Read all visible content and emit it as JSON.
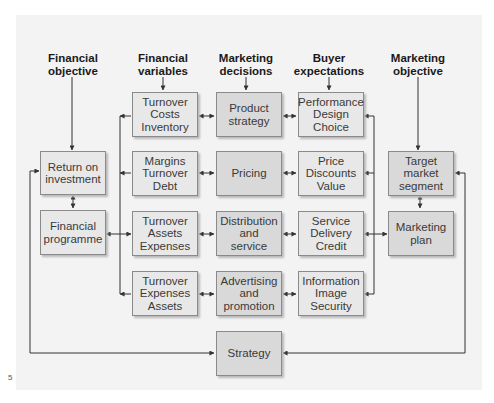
{
  "headings": {
    "financial_objective": [
      "Financial",
      "objective"
    ],
    "financial_variables": [
      "Financial",
      "variables"
    ],
    "marketing_decisions": [
      "Marketing",
      "decisions"
    ],
    "buyer_expectations": [
      "Buyer",
      "expectations"
    ],
    "marketing_objective": [
      "Marketing",
      "objective"
    ]
  },
  "left_column": {
    "return_on_investment": [
      "Return on",
      "investment"
    ],
    "financial_programme": [
      "Financial",
      "programme"
    ]
  },
  "financial_variables": [
    [
      "Turnover",
      "Costs",
      "Inventory"
    ],
    [
      "Margins",
      "Turnover",
      "Debt"
    ],
    [
      "Turnover",
      "Assets",
      "Expenses"
    ],
    [
      "Turnover",
      "Expenses",
      "Assets"
    ]
  ],
  "marketing_decisions": [
    [
      "Product",
      "strategy"
    ],
    [
      "Pricing"
    ],
    [
      "Distribution",
      "and",
      "service"
    ],
    [
      "Advertising",
      "and",
      "promotion"
    ]
  ],
  "buyer_expectations": [
    [
      "Performance",
      "Design",
      "Choice"
    ],
    [
      "Price",
      "Discounts",
      "Value"
    ],
    [
      "Service",
      "Delivery",
      "Credit"
    ],
    [
      "Information",
      "Image",
      "Security"
    ]
  ],
  "right_column": {
    "target_market_segment": [
      "Target",
      "market",
      "segment"
    ],
    "marketing_plan": [
      "Marketing",
      "plan"
    ]
  },
  "bottom": {
    "strategy": [
      "Strategy"
    ]
  },
  "figure_mark": "5",
  "colors": {
    "panel_bg": "#f3f3f3",
    "box_bg": "#e8e8e8",
    "decision_box_bg": "#d9d9d9",
    "border": "#8a8a8a",
    "line": "#333333"
  }
}
